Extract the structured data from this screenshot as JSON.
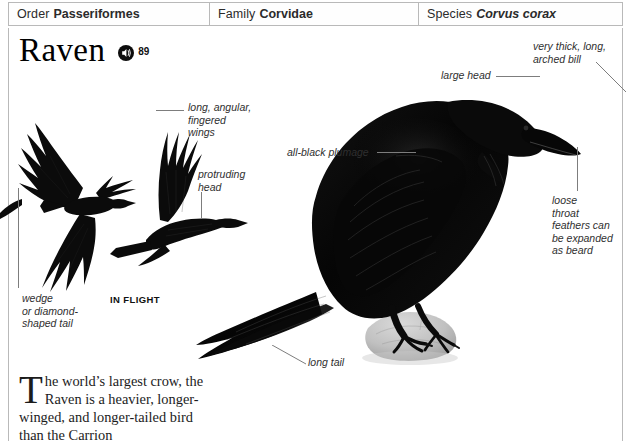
{
  "taxonomy": [
    {
      "label": "Order",
      "value": "Passeriformes",
      "italic": false
    },
    {
      "label": "Family",
      "value": "Corvidae",
      "italic": false
    },
    {
      "label": "Species",
      "value": "Corvus corax",
      "italic": true
    }
  ],
  "title": {
    "name": "Raven",
    "sound_icon": "speaker-icon",
    "sound_number": "89"
  },
  "annotations": [
    {
      "key": "wings",
      "text": "long, angular,\nfingered\nwings"
    },
    {
      "key": "head",
      "text": "protruding\nhead"
    },
    {
      "key": "tail_flight",
      "text": "wedge\nor diamond-\nshaped tail"
    },
    {
      "key": "in_flight",
      "text": "IN FLIGHT"
    },
    {
      "key": "plumage",
      "text": "all-black plumage"
    },
    {
      "key": "large_head",
      "text": "large head"
    },
    {
      "key": "bill",
      "text": "very thick, long,\narched bill"
    },
    {
      "key": "throat",
      "text": "loose\nthroat\nfeathers can\nbe expanded\nas beard"
    },
    {
      "key": "long_tail",
      "text": "long tail"
    }
  ],
  "description": {
    "dropcap": "T",
    "text": "he world’s largest crow, the Raven is a heavier, longer-winged, and longer-tailed bird than the Carrion"
  },
  "colors": {
    "border": "#b9b9b9",
    "leader": "#7d7d7d",
    "text": "#1c1c1c",
    "bird": "#0a0a0a",
    "rock": "#b3b3b3",
    "page": "#ffffff"
  }
}
